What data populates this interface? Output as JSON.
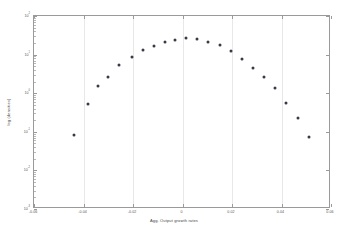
{
  "chart_data": {
    "type": "scatter",
    "title": "",
    "xlabel": "Agg. Output growth rates",
    "ylabel": "log (densities)",
    "xlim": [
      -0.06,
      0.06
    ],
    "ylim": [
      0.001,
      100
    ],
    "yscale": "log",
    "grid": "vertical",
    "legend": "none",
    "xticks": [
      "-0.06",
      "-0.04",
      "-0.02",
      "0",
      "0.02",
      "0.04",
      "0.06"
    ],
    "xtick_values": [
      -0.06,
      -0.04,
      -0.02,
      0,
      0.02,
      0.04,
      0.06
    ],
    "yticks": [
      "10",
      "10",
      "10",
      "10",
      "10",
      "10"
    ],
    "ytick_exponents": [
      "2",
      "1",
      "0",
      "-1",
      "-2",
      "-3"
    ],
    "ytick_values": [
      100,
      10,
      1,
      0.1,
      0.01,
      0.001
    ],
    "marker": "filled-dot",
    "marker_color": "#3a3a46",
    "series": [
      {
        "name": "empirical density",
        "x": [
          -0.0495,
          -0.044,
          -0.038,
          -0.034,
          -0.03,
          -0.0255,
          -0.0205,
          -0.016,
          -0.0115,
          -0.007,
          -0.003,
          0.0015,
          0.006,
          0.0105,
          0.015,
          0.0195,
          0.024,
          0.0285,
          0.033,
          0.0375,
          0.042,
          0.0465,
          0.051,
          0.0555
        ],
        "y": [
          0.00073,
          0.083,
          0.52,
          1.55,
          2.7,
          5.4,
          8.6,
          12.8,
          17.0,
          21.0,
          24.5,
          26.5,
          25.0,
          21.5,
          17.5,
          12.5,
          7.5,
          4.6,
          2.6,
          1.35,
          0.55,
          0.23,
          0.074,
          0.00066
        ]
      }
    ]
  },
  "axes": {
    "xlabel_text": "Agg. Output growth rates",
    "ylabel_text": "log (densities)"
  }
}
